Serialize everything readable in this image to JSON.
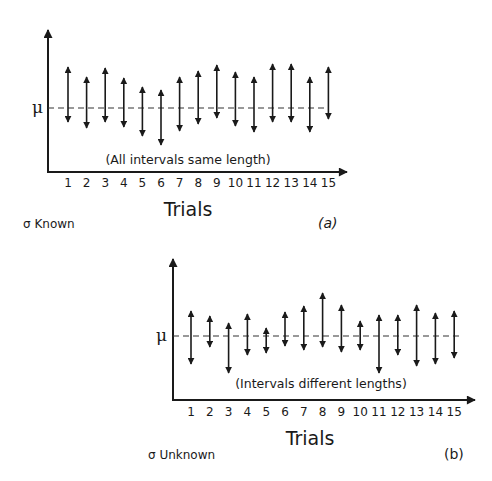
{
  "figure": {
    "panels": [
      {
        "id": "a",
        "panel_label": "(a)",
        "mean_label": "μ",
        "annotation": "(All intervals same length)",
        "xlabel": "Trials",
        "caption": "σ Known",
        "x_ticks": [
          "1",
          "2",
          "3",
          "4",
          "5",
          "6",
          "7",
          "8",
          "9",
          "10",
          "11",
          "12",
          "13",
          "14",
          "15"
        ]
      },
      {
        "id": "b",
        "panel_label": "(b)",
        "mean_label": "μ",
        "annotation": "(Intervals different lengths)",
        "xlabel": "Trials",
        "caption": "σ Unknown",
        "x_ticks": [
          "1",
          "2",
          "3",
          "4",
          "5",
          "6",
          "7",
          "8",
          "9",
          "10",
          "11",
          "12",
          "13",
          "14",
          "15"
        ]
      }
    ],
    "colors": {
      "ink": "#1a1a1a",
      "dash": "#333333",
      "background": "#ffffff"
    }
  },
  "chart_data": [
    {
      "type": "interval",
      "title": "σ Known",
      "panel": "(a)",
      "xlabel": "Trials",
      "ylabel": "μ",
      "annotation": "(All intervals same length)",
      "reference_line": "μ (dashed)",
      "categories": [
        1,
        2,
        3,
        4,
        5,
        6,
        7,
        8,
        9,
        10,
        11,
        12,
        13,
        14,
        15
      ],
      "intervals_px_relative_to_mu": [
        {
          "trial": 1,
          "upper": 41,
          "lower": -14
        },
        {
          "trial": 2,
          "upper": 31,
          "lower": -20
        },
        {
          "trial": 3,
          "upper": 40,
          "lower": -14
        },
        {
          "trial": 4,
          "upper": 30,
          "lower": -19
        },
        {
          "trial": 5,
          "upper": 21,
          "lower": -28
        },
        {
          "trial": 6,
          "upper": 18,
          "lower": -37
        },
        {
          "trial": 7,
          "upper": 31,
          "lower": -23
        },
        {
          "trial": 8,
          "upper": 37,
          "lower": -16
        },
        {
          "trial": 9,
          "upper": 43,
          "lower": -10
        },
        {
          "trial": 10,
          "upper": 36,
          "lower": -18
        },
        {
          "trial": 11,
          "upper": 31,
          "lower": -24
        },
        {
          "trial": 12,
          "upper": 44,
          "lower": -14
        },
        {
          "trial": 13,
          "upper": 44,
          "lower": -14
        },
        {
          "trial": 14,
          "upper": 31,
          "lower": -24
        },
        {
          "trial": 15,
          "upper": 41,
          "lower": -11
        }
      ]
    },
    {
      "type": "interval",
      "title": "σ Unknown",
      "panel": "(b)",
      "xlabel": "Trials",
      "ylabel": "μ",
      "annotation": "(Intervals different lengths)",
      "reference_line": "μ (dashed)",
      "categories": [
        1,
        2,
        3,
        4,
        5,
        6,
        7,
        8,
        9,
        10,
        11,
        12,
        13,
        14,
        15
      ],
      "intervals_px_relative_to_mu": [
        {
          "trial": 1,
          "upper": 25,
          "lower": -28
        },
        {
          "trial": 2,
          "upper": 20,
          "lower": -11
        },
        {
          "trial": 3,
          "upper": 13,
          "lower": -37
        },
        {
          "trial": 4,
          "upper": 22,
          "lower": -19
        },
        {
          "trial": 5,
          "upper": 8,
          "lower": -17
        },
        {
          "trial": 6,
          "upper": 24,
          "lower": -10
        },
        {
          "trial": 7,
          "upper": 30,
          "lower": -14
        },
        {
          "trial": 8,
          "upper": 43,
          "lower": -11
        },
        {
          "trial": 9,
          "upper": 31,
          "lower": -16
        },
        {
          "trial": 10,
          "upper": 15,
          "lower": -14
        },
        {
          "trial": 11,
          "upper": 21,
          "lower": -37
        },
        {
          "trial": 12,
          "upper": 21,
          "lower": -19
        },
        {
          "trial": 13,
          "upper": 31,
          "lower": -30
        },
        {
          "trial": 14,
          "upper": 23,
          "lower": -28
        },
        {
          "trial": 15,
          "upper": 25,
          "lower": -22
        }
      ]
    }
  ]
}
